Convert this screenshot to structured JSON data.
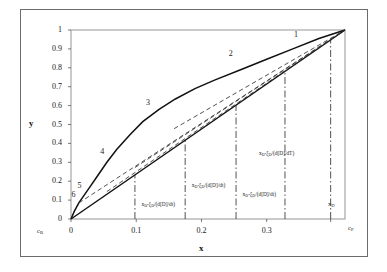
{
  "chart_data": {
    "type": "line",
    "title": "",
    "xlabel": "x",
    "ylabel": "y",
    "xlim": [
      0,
      0.42
    ],
    "ylim": [
      0,
      1
    ],
    "grid": false,
    "legend": "none",
    "x_ticks": [
      "0",
      "0.1",
      "0.2",
      "0.3"
    ],
    "x_tick_values": [
      0,
      0.1,
      0.2,
      0.3
    ],
    "y_ticks": [
      "0",
      "0.1",
      "0.2",
      "0.3",
      "0.4",
      "0.5",
      "0.6",
      "0.7",
      "0.8",
      "0.9",
      "1"
    ],
    "y_tick_values": [
      0,
      0.1,
      0.2,
      0.3,
      0.4,
      0.5,
      0.6,
      0.7,
      0.8,
      0.9,
      1
    ],
    "axis_endpoints": {
      "x_left": "c_B",
      "x_right": "c_P",
      "x_right_tick": "x_D"
    },
    "series": [
      {
        "name": "equilibrium-curve",
        "style": "solid",
        "label": "3",
        "points": [
          [
            0.0,
            0.0
          ],
          [
            0.005,
            0.04
          ],
          [
            0.012,
            0.085
          ],
          [
            0.02,
            0.125
          ],
          [
            0.028,
            0.165
          ],
          [
            0.04,
            0.225
          ],
          [
            0.055,
            0.3
          ],
          [
            0.07,
            0.368
          ],
          [
            0.09,
            0.445
          ],
          [
            0.11,
            0.515
          ],
          [
            0.135,
            0.58
          ],
          [
            0.16,
            0.635
          ],
          [
            0.19,
            0.69
          ],
          [
            0.22,
            0.735
          ],
          [
            0.26,
            0.79
          ],
          [
            0.3,
            0.845
          ],
          [
            0.34,
            0.9
          ],
          [
            0.38,
            0.955
          ],
          [
            0.42,
            1.0
          ]
        ]
      },
      {
        "name": "diagonal-45-line",
        "style": "solid",
        "label": "1",
        "points": [
          [
            0.0,
            0.0
          ],
          [
            0.42,
            1.0
          ]
        ]
      },
      {
        "name": "operating-line-total-reflux",
        "style": "dashed",
        "points": [
          [
            0.055,
            0.145
          ],
          [
            0.42,
            1.0
          ]
        ]
      },
      {
        "name": "operating-line-2",
        "style": "dashed",
        "points": [
          [
            0.012,
            0.085
          ],
          [
            0.42,
            1.0
          ]
        ]
      },
      {
        "name": "operating-line-3",
        "style": "dashed",
        "points": [
          [
            0.098,
            0.272
          ],
          [
            0.42,
            1.0
          ]
        ]
      },
      {
        "name": "operating-line-4",
        "style": "dashed",
        "points": [
          [
            0.158,
            0.478
          ],
          [
            0.42,
            1.0
          ]
        ]
      }
    ],
    "vertical_lines": [
      {
        "name": "vline-1",
        "x": 0.098,
        "style": "dash-dot"
      },
      {
        "name": "vline-2",
        "x": 0.175,
        "style": "dash-dot"
      },
      {
        "name": "vline-3",
        "x": 0.253,
        "style": "dash-dot"
      },
      {
        "name": "vline-4",
        "x": 0.328,
        "style": "dash-dot"
      },
      {
        "name": "vline-xd",
        "x": 0.398,
        "style": "dash-dot"
      }
    ],
    "curve_numbers": [
      {
        "label": "1",
        "x": 0.345,
        "y": 0.975
      },
      {
        "label": "2",
        "x": 0.245,
        "y": 0.875
      },
      {
        "label": "3",
        "x": 0.118,
        "y": 0.615
      },
      {
        "label": "4",
        "x": 0.048,
        "y": 0.355
      },
      {
        "label": "5",
        "x": 0.013,
        "y": 0.175
      },
      {
        "label": "6",
        "x": 0.004,
        "y": 0.128
      }
    ],
    "annotations": [
      {
        "name": "annotation-1",
        "text": "x₀-ξ₀/(d[D]/dt)",
        "x": 0.105,
        "y": 0.075
      },
      {
        "name": "annotation-2",
        "text": "x₀-ξ₀/(d[D]/dt)",
        "x": 0.182,
        "y": 0.175
      },
      {
        "name": "annotation-3",
        "text": "x₀-ξ₀/(d[D]/dt)",
        "x": 0.26,
        "y": 0.125
      },
      {
        "name": "annotation-4",
        "text": "x₀-ξ₀/(d[D]/dT)",
        "x": 0.285,
        "y": 0.345
      }
    ]
  },
  "labels": {
    "y_axis": "y",
    "x_axis": "x",
    "c_b": "c",
    "c_b_sub": "B",
    "c_p": "c",
    "c_p_sub": "P",
    "x_d": "x",
    "x_d_sub": "D"
  },
  "colors": {
    "curve": "#111111",
    "dashed": "#333333",
    "axis": "#555555",
    "frame": "#6b6b6b",
    "text": "#1a1a1a"
  }
}
